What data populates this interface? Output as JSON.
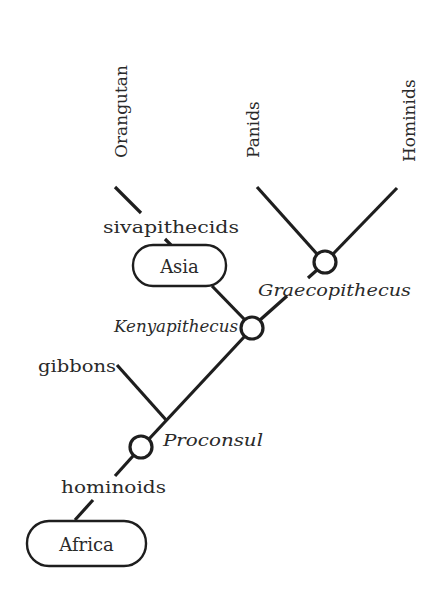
{
  "diagram": {
    "type": "phylogenetic-tree",
    "stroke_color": "#1e1e1e",
    "background": "#ffffff",
    "taxa_top": [
      {
        "label": "Orangutan"
      },
      {
        "label": "Panids"
      },
      {
        "label": "Hominids"
      }
    ],
    "regions": [
      {
        "label": "Asia"
      },
      {
        "label": "Africa"
      }
    ],
    "group_labels": [
      {
        "label": "sivapithecids"
      },
      {
        "label": "gibbons"
      },
      {
        "label": "hominoids"
      }
    ],
    "nodes": [
      {
        "label": "Graecopithecus"
      },
      {
        "label": "Kenyapithecus"
      },
      {
        "label": "Proconsul"
      }
    ]
  }
}
